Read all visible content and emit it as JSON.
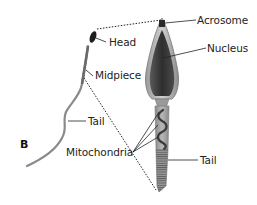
{
  "figure": {
    "panel_letter": "B",
    "labels": {
      "head": "Head",
      "midpiece": "Midpiece",
      "tail_small": "Tail",
      "acrosome": "Acrosome",
      "nucleus": "Nucleus",
      "mitochondria": "Mitochondria",
      "tail_large": "Tail"
    },
    "colors": {
      "ink": "#222222",
      "body_gray": "#8a8a8a",
      "nucleus_dark": "#3a3a3a",
      "background": "#ffffff"
    }
  }
}
